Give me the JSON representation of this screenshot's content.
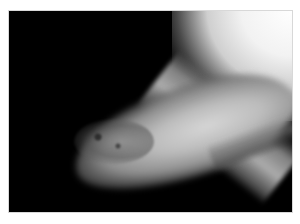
{
  "image": {
    "type": "grayscale radiograph",
    "border_color": "#ffffff",
    "background_color": "#000000"
  }
}
